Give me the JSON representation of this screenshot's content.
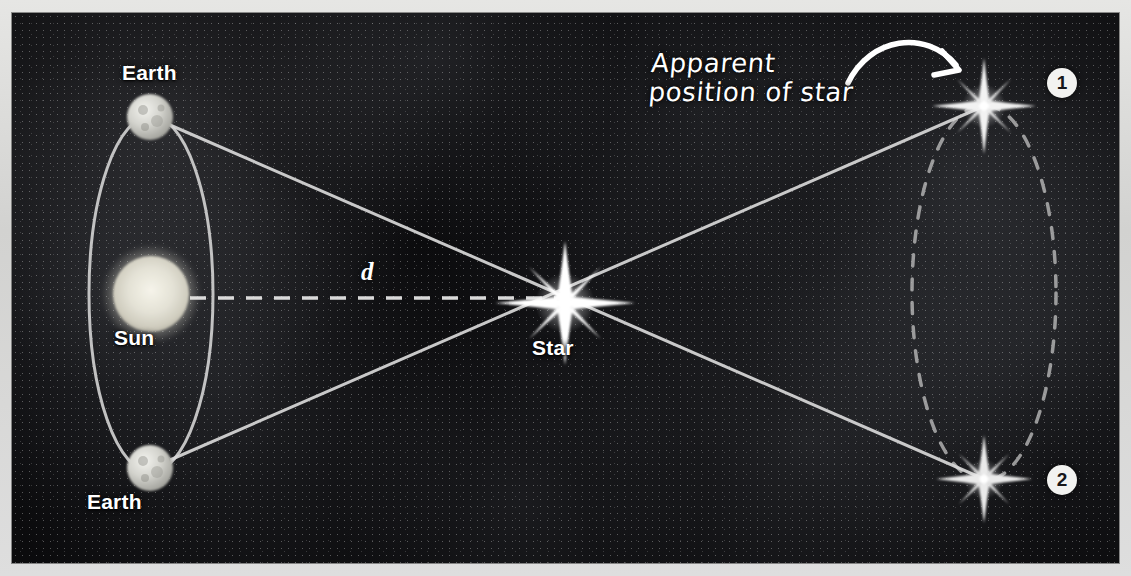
{
  "figure": {
    "frame_color": "#d9d9d7",
    "background_color": "#0b0b0d",
    "line_color": "#d9d9d9",
    "width": 1107,
    "height": 550
  },
  "labels": {
    "earth_top": "Earth",
    "earth_bottom": "Earth",
    "sun": "Sun",
    "star": "Star",
    "distance_symbol": "d"
  },
  "annotation": {
    "line1": "Apparent",
    "line2": "position of star",
    "arrow": "curved-arrow pointing to star position 1"
  },
  "badges": [
    {
      "id": "1",
      "label": "1",
      "position": "top-right"
    },
    {
      "id": "2",
      "label": "2",
      "position": "bottom-right"
    }
  ],
  "objects": {
    "sun": {
      "name": "Sun",
      "cx": 139,
      "cy": 281,
      "r": 38,
      "color": "#e8e6dc"
    },
    "earth_top": {
      "name": "Earth",
      "cx": 138,
      "cy": 104,
      "r": 22,
      "color": "#d6d6d2"
    },
    "earth_bottom": {
      "name": "Earth",
      "cx": 138,
      "cy": 455,
      "r": 22,
      "color": "#d6d6d2"
    },
    "star_real": {
      "name": "Star",
      "cx": 553,
      "cy": 290,
      "size": 58
    },
    "star_apparent_1": {
      "name": "Apparent position of star 1",
      "cx": 972,
      "cy": 93,
      "size": 44
    },
    "star_apparent_2": {
      "name": "Apparent position of star 2",
      "cx": 972,
      "cy": 466,
      "size": 40
    }
  },
  "geometry": {
    "earth_orbit": {
      "cx": 139,
      "cy": 281,
      "rx": 62,
      "ry": 178,
      "style": "solid"
    },
    "apparent_ellipse": {
      "cx": 972,
      "cy": 280,
      "rx": 72,
      "ry": 188,
      "style": "dashed"
    },
    "baseline": {
      "from": "Sun",
      "to": "Star",
      "style": "dashed",
      "label": "d"
    },
    "sightlines": [
      {
        "from": "Earth (top)",
        "through": "Star",
        "to": "Apparent position 2"
      },
      {
        "from": "Earth (bottom)",
        "through": "Star",
        "to": "Apparent position 1"
      }
    ]
  }
}
